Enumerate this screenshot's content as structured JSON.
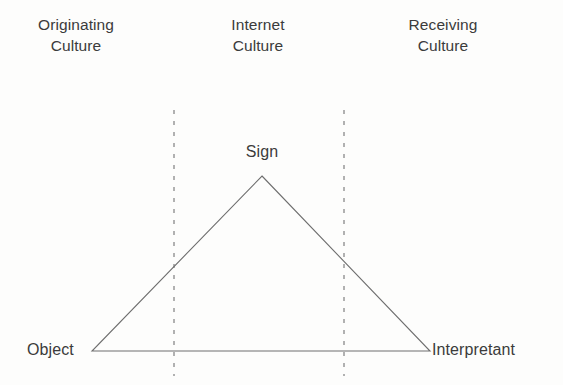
{
  "figure": {
    "background_color": "#fdfdfc",
    "ink_color": "#3b3b3b",
    "line_color": "#6e6e6e"
  },
  "columns": [
    {
      "id": "originating",
      "line1": "Originating",
      "line2": "Culture",
      "center_x": 76
    },
    {
      "id": "internet",
      "line1": "Internet",
      "line2": "Culture",
      "center_x": 258
    },
    {
      "id": "receiving",
      "line1": "Receiving",
      "line2": "Culture",
      "center_x": 443
    }
  ],
  "nodes": {
    "sign": "Sign",
    "object": "Object",
    "interpretant": "Interpretant"
  },
  "geometry": {
    "apex": {
      "x": 262,
      "y": 176
    },
    "left_vertex": {
      "x": 92,
      "y": 351
    },
    "right_vertex": {
      "x": 430,
      "y": 351
    },
    "divider_left_x": 174,
    "divider_right_x": 344,
    "divider_top_y": 110,
    "divider_bottom_y": 376
  }
}
